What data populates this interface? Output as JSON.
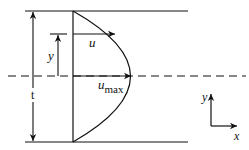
{
  "diagram": {
    "labels": {
      "thickness": "t",
      "position": "y",
      "velocity": "u",
      "velocity_max_base": "u",
      "velocity_max_sub": "max",
      "axis_y": "y",
      "axis_x": "x"
    },
    "colors": {
      "line": "#111111",
      "background": "#ffffff"
    }
  }
}
